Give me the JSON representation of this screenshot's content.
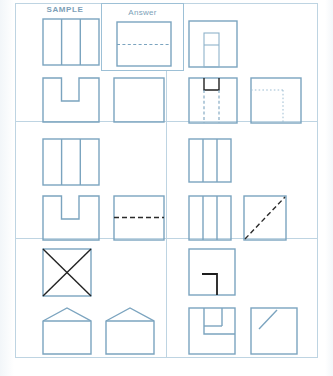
{
  "page": {
    "width": 333,
    "height": 376,
    "background": "#ffffff",
    "line_color": "#7ba4bf",
    "grid_color": "#bed4e2",
    "label_color": "#7d9fb8",
    "dark_line_color": "#1d1d1d"
  },
  "labels": {
    "sample": "SAMPLE",
    "answer": "Answer"
  },
  "panels": [
    {
      "id": "panel-sample",
      "position": "top-left",
      "label": "SAMPLE",
      "has_answer_box": true,
      "figures": [
        {
          "name": "square-three-vertical-strips",
          "row": 1,
          "col": 1,
          "description": "Square divided into three vertical strips"
        },
        {
          "name": "square-u-notch",
          "row": 2,
          "col": 1,
          "description": "Square with U shaped notch cut from top center"
        },
        {
          "name": "plain-square",
          "row": 2,
          "col": 2,
          "description": "Plain empty square"
        }
      ],
      "answer": {
        "name": "answer-square-horizontal-dashed",
        "description": "Square with a horizontal dashed fold line across the middle"
      }
    },
    {
      "id": "panel-2",
      "position": "top-right",
      "label": "",
      "has_answer_box": false,
      "figures": [
        {
          "name": "square-inner-vertical-rectangle",
          "row": 1,
          "col": 1,
          "description": "Square with narrow vertical rectangle rising from bottom edge, split into two parts"
        },
        {
          "name": "square-dark-notch-dashed-verticals",
          "row": 2,
          "col": 1,
          "description": "Square with dark notch at top center and two vertical dashed fold lines"
        },
        {
          "name": "square-dotted-inner-corner",
          "row": 2,
          "col": 2,
          "description": "Square with dotted inner corner lines forming an L"
        }
      ]
    },
    {
      "id": "panel-3",
      "position": "middle-left",
      "label": "",
      "has_answer_box": false,
      "figures": [
        {
          "name": "square-three-vertical-strips",
          "row": 1,
          "col": 1,
          "description": "Square divided into three vertical strips"
        },
        {
          "name": "square-u-notch",
          "row": 2,
          "col": 1,
          "description": "Square with U shaped notch cut from top center"
        },
        {
          "name": "square-horizontal-dashed",
          "row": 2,
          "col": 2,
          "description": "Square with horizontal dark dashed line across the middle"
        }
      ]
    },
    {
      "id": "panel-4",
      "position": "middle-right",
      "label": "",
      "has_answer_box": false,
      "figures": [
        {
          "name": "square-three-vertical-strips",
          "row": 1,
          "col": 1,
          "description": "Square divided into three vertical strips"
        },
        {
          "name": "square-three-vertical-strips",
          "row": 2,
          "col": 1,
          "description": "Square divided into three vertical strips"
        },
        {
          "name": "square-diagonal-dashed",
          "row": 2,
          "col": 2,
          "description": "Square with dark dashed diagonal from bottom left to top right"
        }
      ]
    },
    {
      "id": "panel-5",
      "position": "bottom-left",
      "label": "",
      "has_answer_box": false,
      "figures": [
        {
          "name": "square-x-diagonals",
          "row": 1,
          "col": 1,
          "description": "Square with both diagonals drawn forming an X"
        },
        {
          "name": "house-pentagon",
          "row": 2,
          "col": 1,
          "description": "House shape: square with triangular roof"
        },
        {
          "name": "house-pentagon",
          "row": 2,
          "col": 2,
          "description": "House shape: square with triangular roof"
        }
      ]
    },
    {
      "id": "panel-6",
      "position": "bottom-right",
      "label": "",
      "has_answer_box": false,
      "figures": [
        {
          "name": "square-dark-inner-l-corner",
          "row": 1,
          "col": 1,
          "description": "Square with dark L shaped line in lower right quadrant"
        },
        {
          "name": "square-inner-l-step",
          "row": 2,
          "col": 1,
          "description": "Square with inner step forming a small quadrant block"
        },
        {
          "name": "square-short-diagonal",
          "row": 2,
          "col": 2,
          "description": "Square with a short diagonal line in the upper left corner"
        }
      ]
    }
  ]
}
